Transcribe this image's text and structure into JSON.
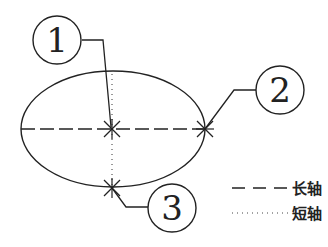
{
  "diagram": {
    "type": "ellipse-axes",
    "stroke_color": "#222222",
    "callouts": [
      {
        "id": "1",
        "label": "1",
        "target": "center"
      },
      {
        "id": "2",
        "label": "2",
        "target": "major-axis-end"
      },
      {
        "id": "3",
        "label": "3",
        "target": "minor-axis-end"
      }
    ],
    "legend": [
      {
        "style": "dashed",
        "label": "长轴"
      },
      {
        "style": "dotted",
        "label": "短轴"
      }
    ]
  }
}
